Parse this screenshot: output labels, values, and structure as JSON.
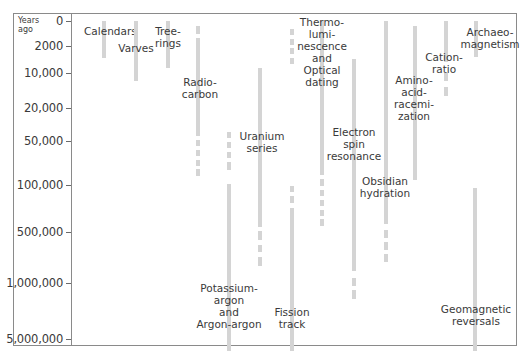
{
  "chart_data": {
    "type": "table",
    "title": "",
    "ylabel": "Years ago",
    "yscale": "nonlinear",
    "y_ticks": [
      {
        "label": "0",
        "y": 21
      },
      {
        "label": "2000",
        "y": 46
      },
      {
        "label": "10,000",
        "y": 73
      },
      {
        "label": "20,000",
        "y": 108
      },
      {
        "label": "50,000",
        "y": 141
      },
      {
        "label": "100,000",
        "y": 185
      },
      {
        "label": "500,000",
        "y": 232
      },
      {
        "label": "1,000,000",
        "y": 283
      },
      {
        "label": "5,000,000",
        "y": 339
      }
    ],
    "methods": [
      {
        "name": "Calendars",
        "label_lines": [
          "Calendars"
        ],
        "x": 102,
        "label_x": 84,
        "label_y": 25,
        "label_align": "left",
        "range": "0 - ~5,000",
        "segments": [
          [
            21,
            58
          ]
        ]
      },
      {
        "name": "Varves",
        "label_lines": [
          "Varves"
        ],
        "x": 134,
        "label_x": 136,
        "label_y": 42,
        "range": "0 - ~15,000",
        "segments": [
          [
            21,
            81
          ]
        ]
      },
      {
        "name": "Tree-rings",
        "label_lines": [
          "Tree-",
          "rings"
        ],
        "x": 166,
        "label_x": 168,
        "label_y": 25,
        "range": "0 - ~11,000",
        "segments": [
          [
            21,
            68
          ]
        ]
      },
      {
        "name": "Radiocarbon",
        "label_lines": [
          "Radio-",
          "carbon"
        ],
        "x": 196,
        "label_x": 200,
        "label_y": 76,
        "range": "~300 - ~100,000",
        "segments": [
          [
            26,
            34
          ],
          [
            38,
            136
          ],
          [
            140,
            146
          ],
          [
            150,
            156
          ],
          [
            160,
            166
          ],
          [
            169,
            176
          ]
        ]
      },
      {
        "name": "Potassium-argon and Argon-argon",
        "label_lines": [
          "Potassium-",
          "argon",
          "and",
          "Argon-argon"
        ],
        "x": 227,
        "label_x": 229,
        "label_y": 282,
        "range": "~50,000 - >5,000,000",
        "segments": [
          [
            132,
            138
          ],
          [
            142,
            148
          ],
          [
            152,
            158
          ],
          [
            162,
            170
          ],
          [
            184,
            351
          ]
        ]
      },
      {
        "name": "Uranium series",
        "label_lines": [
          "Uranium",
          "series"
        ],
        "x": 258,
        "label_x": 262,
        "label_y": 130,
        "range": "~10,000 - ~700,000",
        "segments": [
          [
            68,
            227
          ],
          [
            231,
            240
          ],
          [
            245,
            252
          ],
          [
            257,
            266
          ]
        ]
      },
      {
        "name": "Fission track",
        "label_lines": [
          "Fission",
          "track"
        ],
        "x": 290,
        "label_x": 292,
        "label_y": 306,
        "range": "~100,000 - >5,000,000",
        "segments": [
          [
            186,
            192
          ],
          [
            196,
            203
          ],
          [
            208,
            351
          ]
        ]
      },
      {
        "name": "Thermoluminescence and Optical dating (early dashes)",
        "label_lines": [],
        "x": 290,
        "label_x": 0,
        "label_y": 0,
        "range": "~500 - ~8,000 (uncertain)",
        "segments": [
          [
            29,
            35
          ],
          [
            39,
            45
          ],
          [
            48,
            54
          ],
          [
            58,
            64
          ]
        ]
      },
      {
        "name": "Thermoluminescence and Optical dating",
        "label_lines": [
          "Thermo-",
          "lumi-",
          "nescence",
          "and",
          "Optical",
          "dating"
        ],
        "x": 320,
        "label_x": 322,
        "label_y": 16,
        "range": "0 - ~500,000",
        "segments": [
          [
            21,
            175
          ],
          [
            179,
            186
          ],
          [
            190,
            196
          ],
          [
            200,
            206
          ],
          [
            210,
            216
          ],
          [
            219,
            226
          ]
        ]
      },
      {
        "name": "Electron spin resonance",
        "label_lines": [
          "Electron",
          "spin",
          "resonance"
        ],
        "x": 352,
        "label_x": 354,
        "label_y": 126,
        "range": "~5,000 - ~2,000,000",
        "segments": [
          [
            59,
            271
          ],
          [
            278,
            286
          ],
          [
            290,
            299
          ]
        ]
      },
      {
        "name": "Obsidian hydration",
        "label_lines": [
          "Obsidian",
          "hydration"
        ],
        "x": 384,
        "label_x": 385,
        "label_y": 175,
        "range": "0 - ~800,000",
        "segments": [
          [
            21,
            224
          ],
          [
            230,
            238
          ],
          [
            242,
            250
          ],
          [
            254,
            262
          ]
        ]
      },
      {
        "name": "Amino-acid racemization",
        "label_lines": [
          "Amino-",
          "acid-",
          "racemi-",
          "zation"
        ],
        "x": 413,
        "label_x": 414,
        "label_y": 74,
        "range": "~300 - ~90,000",
        "segments": [
          [
            26,
            180
          ]
        ]
      },
      {
        "name": "Cation-ratio",
        "label_lines": [
          "Cation-",
          "ratio"
        ],
        "x": 444,
        "label_x": 444,
        "label_y": 51,
        "range": "0 - ~15,000",
        "segments": [
          [
            21,
            62
          ],
          [
            73,
            81
          ],
          [
            87,
            96
          ]
        ]
      },
      {
        "name": "Archaeomagnetism",
        "label_lines": [
          "Archaeo-",
          "magnetism"
        ],
        "x": 474,
        "label_x": 490,
        "label_y": 26,
        "range": "0 - ~4,000",
        "segments": [
          [
            21,
            57
          ]
        ]
      },
      {
        "name": "Geomagnetic reversals",
        "label_lines": [
          "Geomagnetic",
          "reversals"
        ],
        "x": 473,
        "label_x": 476,
        "label_y": 303,
        "range": "~100,000 - >5,000,000",
        "segments": [
          [
            188,
            351
          ]
        ]
      }
    ],
    "grid": false,
    "legend": "none",
    "bar_color": "#d4d4d4",
    "axis_color": "#8a8a8a"
  },
  "axis": {
    "years_ago_line1": "Years",
    "years_ago_line2": "ago"
  }
}
